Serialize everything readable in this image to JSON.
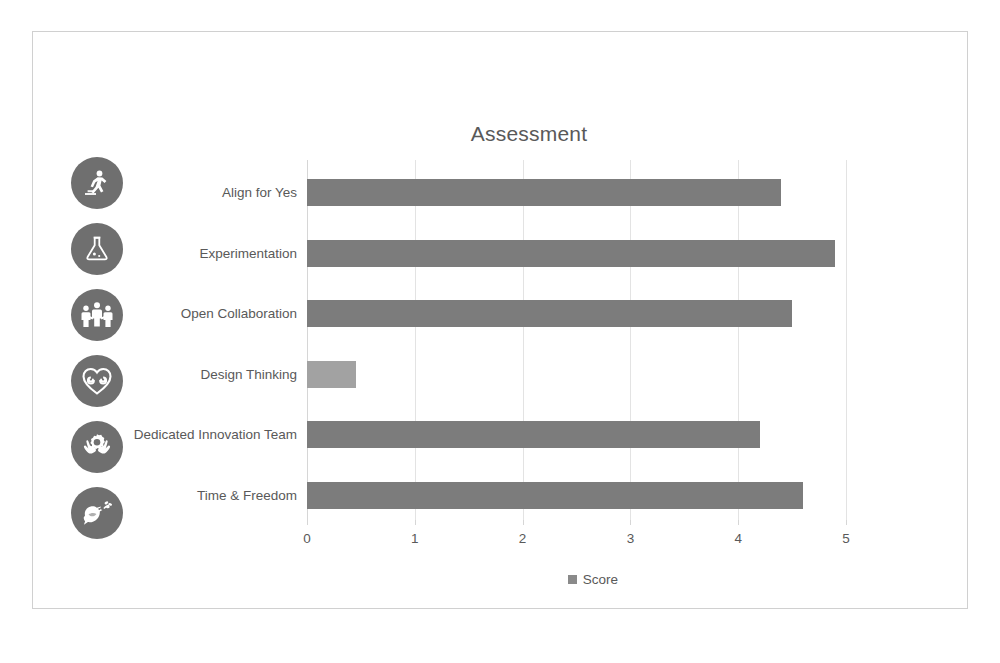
{
  "chart_data": {
    "type": "bar",
    "orientation": "horizontal",
    "title": "Assessment",
    "xlabel": "",
    "ylabel": "",
    "xlim": [
      0,
      5
    ],
    "xticks": [
      "0",
      "1",
      "2",
      "3",
      "4",
      "5"
    ],
    "grid": true,
    "legend": {
      "position": "bottom",
      "entries": [
        {
          "name": "Score",
          "color": "#8a8a8a"
        }
      ]
    },
    "categories": [
      "Align for Yes",
      "Experimentation",
      "Open Collaboration",
      "Design Thinking",
      "Dedicated Innovation Team",
      "Time & Freedom"
    ],
    "series": [
      {
        "name": "Score",
        "values": [
          4.4,
          4.9,
          4.5,
          0.45,
          4.2,
          4.6
        ]
      }
    ],
    "bar_colors": [
      "#7c7c7c",
      "#7c7c7c",
      "#7c7c7c",
      "#a2a2a2",
      "#7c7c7c",
      "#7c7c7c"
    ]
  },
  "icons": [
    {
      "name": "running-person-icon",
      "label": "Align for Yes"
    },
    {
      "name": "flask-icon",
      "label": "Experimentation"
    },
    {
      "name": "three-people-icon",
      "label": "Open Collaboration"
    },
    {
      "name": "heart-spiral-icon",
      "label": "Design Thinking"
    },
    {
      "name": "hands-holding-gear-icon",
      "label": "Dedicated Innovation Team"
    },
    {
      "name": "dove-olive-branch-icon",
      "label": "Time & Freedom"
    }
  ],
  "colors": {
    "bar_primary": "#7c7c7c",
    "bar_highlight": "#a2a2a2",
    "icon_badge": "#6f6f6f",
    "text": "#595959",
    "gridline": "#e3e3e3",
    "frame_border": "#d0d0d0"
  }
}
